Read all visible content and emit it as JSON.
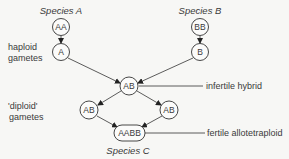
{
  "species": {
    "a": "Species A",
    "b": "Species B",
    "c": "Species C"
  },
  "nodes": {
    "aa": "AA",
    "a": "A",
    "bb": "BB",
    "b": "B",
    "hybrid": "AB",
    "left_gamete": "AB",
    "right_gamete": "AB",
    "aabb": "AABB"
  },
  "labels": {
    "haploid_line1": "haploid",
    "haploid_line2": "gametes",
    "diploid_line1": "'diploid'",
    "diploid_line2": "gametes",
    "infertile": "infertile hybrid",
    "fertile": "fertile allotetraploid"
  }
}
